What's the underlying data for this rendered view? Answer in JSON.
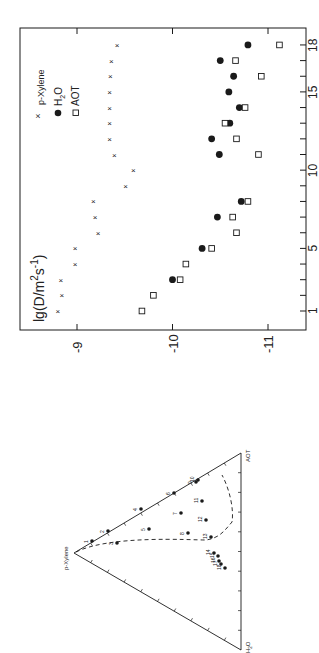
{
  "chart_data": [
    {
      "type": "scatter",
      "orientation_note": "figure rotated 90deg counter-clockwise",
      "title": "",
      "xlabel": "",
      "ylabel": "lg(D/m2s-1)",
      "ylabel_parts": {
        "main": "lg(D/m",
        "sup1": "2",
        "mid": "s",
        "sup2": "-1",
        "end": ")"
      },
      "x": [
        1,
        2,
        3,
        4,
        5,
        6,
        7,
        8,
        9,
        10,
        11,
        12,
        13,
        14,
        15,
        16,
        17,
        18
      ],
      "x_tick_labels": [
        "1",
        "5",
        "10",
        "15",
        "18"
      ],
      "x_tick_label_values": [
        1,
        5,
        10,
        15,
        18
      ],
      "y_tick_labels": [
        "-9",
        "-10",
        "-11"
      ],
      "y_tick_values": [
        -9,
        -10,
        -11
      ],
      "ylim": [
        -8.55,
        -11.3
      ],
      "xlim": [
        0.5,
        18.8
      ],
      "grid": false,
      "legend_position": "upper right (in rotated view: top-left region)",
      "series": [
        {
          "name": "p-Xylene",
          "marker": "x",
          "x": [
            1,
            2,
            3,
            4,
            5,
            6,
            7,
            8,
            9,
            10,
            11,
            12,
            13,
            14,
            15,
            16,
            17,
            18
          ],
          "values": [
            -8.8,
            -8.84,
            -8.83,
            -8.98,
            -8.98,
            -9.22,
            -9.19,
            -9.17,
            -9.51,
            -9.59,
            -9.39,
            -9.34,
            -9.34,
            -9.34,
            -9.34,
            -9.35,
            -9.36,
            -9.42
          ]
        },
        {
          "name": "H2O",
          "marker": "filled-circle",
          "x": [
            3,
            5,
            7,
            8,
            11,
            12,
            13,
            14,
            15,
            16,
            17,
            18
          ],
          "values": [
            -10.0,
            -10.31,
            -10.47,
            -10.72,
            -10.49,
            -10.41,
            -10.6,
            -10.7,
            -10.59,
            -10.64,
            -10.5,
            -10.79
          ]
        },
        {
          "name": "AOT",
          "marker": "open-square",
          "x": [
            1,
            2,
            3,
            4,
            5,
            6,
            7,
            8,
            11,
            12,
            13,
            14,
            16,
            17,
            18
          ],
          "values": [
            -9.68,
            -9.8,
            -10.08,
            -10.14,
            -10.41,
            -10.67,
            -10.63,
            -10.79,
            -10.9,
            -10.67,
            -10.55,
            -10.76,
            -10.93,
            -10.66,
            -11.12
          ]
        }
      ]
    },
    {
      "type": "ternary",
      "vertices": [
        "p-Xylene",
        "AOT",
        "H2O"
      ],
      "boundary": "dashed curve (one-phase region)",
      "point_labels": [
        "1",
        "2",
        "3",
        "4",
        "5",
        "6",
        "7",
        "8",
        "9",
        "10",
        "11",
        "12",
        "13",
        "14",
        "15",
        "16",
        "17",
        "18"
      ]
    }
  ],
  "legend": {
    "items": [
      {
        "label": "p-Xylene",
        "marker": "x"
      },
      {
        "label": "H",
        "sub": "2",
        "suffix": "O",
        "marker": "filled-circle"
      },
      {
        "label": "AOT",
        "marker": "open-square"
      }
    ]
  },
  "ternary": {
    "labels": {
      "top": "p-Xylene",
      "right": "AOT",
      "bottom_main": "H",
      "bottom_sub": "2",
      "bottom_suffix": "O"
    },
    "points": [
      {
        "n": "1",
        "px": 92,
        "py": 541
      },
      {
        "n": "2",
        "px": 108,
        "py": 531
      },
      {
        "n": "3",
        "px": 117,
        "py": 543
      },
      {
        "n": "4",
        "px": 141,
        "py": 509
      },
      {
        "n": "5",
        "px": 149,
        "py": 529
      },
      {
        "n": "6",
        "px": 174,
        "py": 493
      },
      {
        "n": "7",
        "px": 181,
        "py": 513
      },
      {
        "n": "8",
        "px": 188,
        "py": 533
      },
      {
        "n": "9",
        "px": 196,
        "py": 482
      },
      {
        "n": "10",
        "px": 198,
        "py": 480
      },
      {
        "n": "11",
        "px": 202,
        "py": 501
      },
      {
        "n": "12",
        "px": 206,
        "py": 520
      },
      {
        "n": "13",
        "px": 211,
        "py": 537
      },
      {
        "n": "14",
        "px": 214,
        "py": 553
      },
      {
        "n": "15",
        "px": 218,
        "py": 556
      },
      {
        "n": "16",
        "px": 219,
        "py": 561
      },
      {
        "n": "17",
        "px": 221,
        "py": 564
      },
      {
        "n": "18",
        "px": 225,
        "py": 568
      }
    ]
  },
  "colors": {
    "ink": "#1a1a1a",
    "background": "#ffffff"
  }
}
